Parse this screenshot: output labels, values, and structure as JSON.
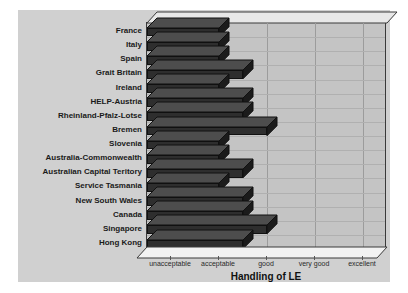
{
  "chart_data": {
    "type": "bar",
    "orientation": "horizontal",
    "title": "",
    "xlabel": "Handling of LE",
    "ylabel": "",
    "grid": true,
    "legend": "none",
    "xtick_labels": [
      "unacceptable",
      "acceptable",
      "good",
      "very good",
      "excellent"
    ],
    "xtick_values": [
      1,
      2,
      3,
      4,
      5
    ],
    "xlim": [
      0.5,
      5.5
    ],
    "categories": [
      "France",
      "Italy",
      "Spain",
      "Grait Britain",
      "Ireland",
      "HELP-Austria",
      "Rheinland-Pfalz-Lotse",
      "Bremen",
      "Slovenia",
      "Australia-Commonwealth",
      "Australian Capital Teritory",
      "Service Tasmania",
      "New South Wales",
      "Canada",
      "Singapore",
      "Hong Kong"
    ],
    "values": [
      2.0,
      2.0,
      2.0,
      2.5,
      2.0,
      2.5,
      2.5,
      3.0,
      2.0,
      2.0,
      2.5,
      2.0,
      2.5,
      2.5,
      3.0,
      2.5
    ]
  },
  "style": {
    "figure_bg": "#d0d0d0",
    "plot_bg": "#c4c4c4",
    "bar_front": "#2e2e2e",
    "bar_top": "#4d4d4d",
    "bar_side": "#1b1b1b",
    "grid_color": "#9c9c9c",
    "axis_color": "#3a3a3a",
    "text_color": "#1a1a1a"
  }
}
